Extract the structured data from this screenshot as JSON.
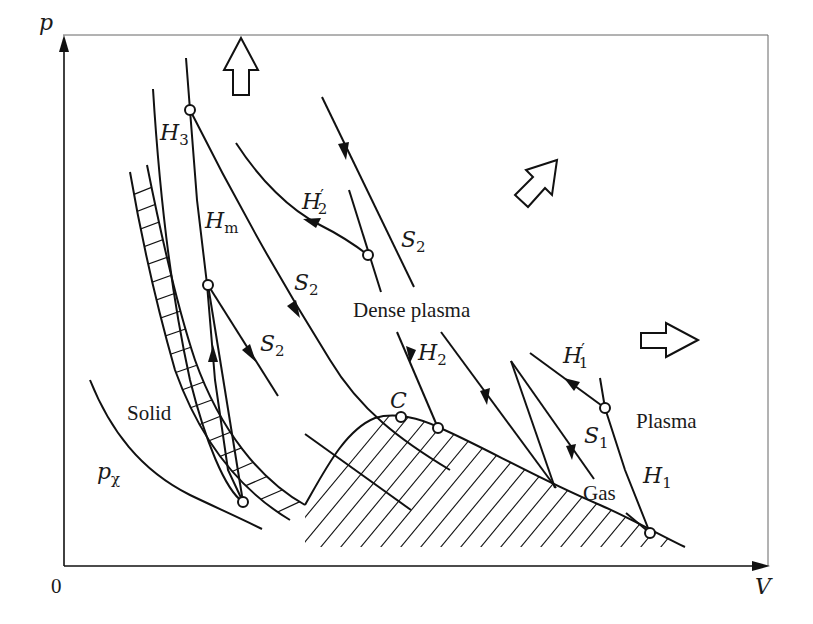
{
  "figure": {
    "type": "phase-diagram",
    "colors": {
      "stroke": "#111111",
      "frame": "#555555",
      "background": "#ffffff"
    }
  },
  "axes": {
    "y_label": "p",
    "x_label": "V",
    "origin_label": "0"
  },
  "regions": {
    "solid": "Solid",
    "dense_plasma": "Dense plasma",
    "gas": "Gas",
    "plasma": "Plasma"
  },
  "curves": {
    "h3": {
      "base": "H",
      "sub": "3",
      "prime": ""
    },
    "hm": {
      "base": "H",
      "sub": "m",
      "prime": ""
    },
    "h2p": {
      "base": "H",
      "sub": "2",
      "prime": "′"
    },
    "s2_upper": {
      "base": "S",
      "sub": "2",
      "prime": ""
    },
    "s2_middle": {
      "base": "S",
      "sub": "2",
      "prime": ""
    },
    "s2_lower": {
      "base": "S",
      "sub": "2",
      "prime": ""
    },
    "h2": {
      "base": "H",
      "sub": "2",
      "prime": ""
    },
    "h1p": {
      "base": "H",
      "sub": "1",
      "prime": "′"
    },
    "s1": {
      "base": "S",
      "sub": "1",
      "prime": ""
    },
    "h1": {
      "base": "H",
      "sub": "1",
      "prime": ""
    },
    "p_chi": {
      "base": "p",
      "sub": "χ",
      "prime": ""
    }
  },
  "points": {
    "critical": "C"
  },
  "direction_arrows": [
    {
      "name": "up",
      "direction": "up"
    },
    {
      "name": "diagonal",
      "direction": "up-right"
    },
    {
      "name": "right",
      "direction": "right"
    }
  ]
}
